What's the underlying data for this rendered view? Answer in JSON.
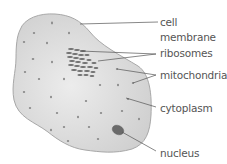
{
  "diagram": {
    "labels": {
      "cell_line1": "cell",
      "cell_line2": "membrane",
      "ribosomes": "ribosomes",
      "mitochondria": "mitochondria",
      "cytoplasm": "cytoplasm",
      "nucleus": "nucleus"
    },
    "colors": {
      "cytoplasm_fill": "#d9d9d9",
      "membrane_stroke": "#a8a8a8",
      "nucleus_fill": "#6a6a6a",
      "ribosome_fill": "#707070",
      "leader_line": "#555555",
      "label_text": "#555555"
    }
  }
}
